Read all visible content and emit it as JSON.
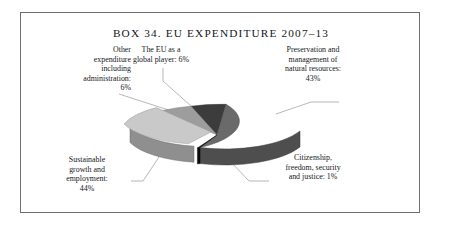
{
  "figure": {
    "box_label": "BOX 34.",
    "title": "BOX 34.   EU EXPENDITURE 2007–13",
    "border_color": "#6e6e6e",
    "background": "#ffffff"
  },
  "labels": {
    "other_expenditure": "Other\nexpenditure\nincluding\nadministration:\n6%",
    "global_player": "The EU as a\nglobal player: 6%",
    "preservation": "Preservation and\nmanagement of\nnatural resources:\n43%",
    "citizenship": "Citizenship,\nfreedom, security\nand justice: 1%",
    "sustainable": "Sustainable\ngrowth and\nemployment:\n44%"
  },
  "chart_data": {
    "type": "pie",
    "title": "BOX 34.   EU EXPENDITURE 2007–13",
    "xlabel": "",
    "ylabel": "",
    "grid": false,
    "legend": "none",
    "style": "3d-exploded-pie",
    "labels_inline": true,
    "units": "percent",
    "total": 100,
    "categories": [
      "Preservation and management of natural resources",
      "Citizenship, freedom, security and justice",
      "Sustainable growth and employment",
      "Other expenditure including administration",
      "The EU as a global player"
    ],
    "values": [
      43,
      1,
      44,
      6,
      6
    ],
    "slices": [
      {
        "name": "The EU as a global player",
        "value": 6,
        "value_text": "6%",
        "color": "#3c3c3c",
        "side_color": "#2b2b2b",
        "exploded": false
      },
      {
        "name": "Preservation and management of natural resources",
        "value": 43,
        "value_text": "43%",
        "color": "#6a6a6a",
        "side_color": "#4e4e4e",
        "exploded": false
      },
      {
        "name": "Citizenship, freedom, security and justice",
        "value": 1,
        "value_text": "1%",
        "color": "#101010",
        "side_color": "#0a0a0a",
        "exploded": false
      },
      {
        "name": "Sustainable growth and employment",
        "value": 44,
        "value_text": "44%",
        "color": "#c9c9c9",
        "side_color": "#8f8f8f",
        "exploded": true
      },
      {
        "name": "Other expenditure including administration",
        "value": 6,
        "value_text": "6%",
        "color": "#9d9d9d",
        "side_color": "#7a7a7a",
        "exploded": false
      }
    ]
  }
}
